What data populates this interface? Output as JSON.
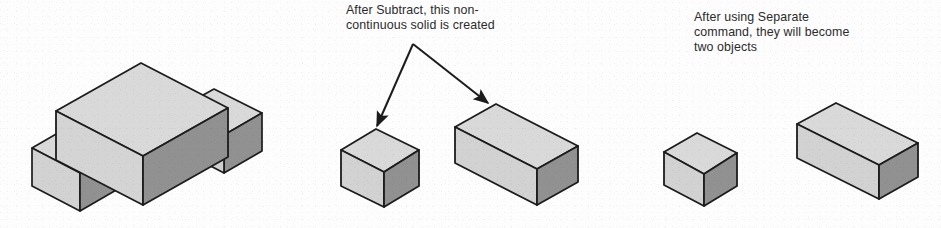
{
  "figure": {
    "background_color": "#fdfdfd"
  },
  "palette": {
    "top_face": "#d9d9d9",
    "left_face": "#d2d2d2",
    "front_face": "#919191",
    "outline": "#1c1c1c",
    "text": "#2b2b2b",
    "arrow": "#1c1c1c"
  },
  "annotations": [
    {
      "id": "anno-subtract",
      "name": "annotation-subtract",
      "lines": [
        "After Subtract, this non-",
        "continuous solid is created"
      ],
      "text": "After Subtract, this non-\ncontinuous solid is created",
      "x": 346,
      "y": 3
    },
    {
      "id": "anno-separate",
      "name": "annotation-separate",
      "lines": [
        "After using Separate",
        "command, they will become",
        "two objects"
      ],
      "text": "After using Separate\ncommand, they will become\ntwo objects",
      "x": 694,
      "y": 10
    }
  ],
  "arrows": [
    {
      "name": "arrow-to-small-cube",
      "from": [
        413,
        44
      ],
      "to": [
        374,
        131
      ],
      "head": "filled-triangle"
    },
    {
      "name": "arrow-to-large-box",
      "from": [
        413,
        44
      ],
      "to": [
        491,
        108
      ],
      "head": "filled-triangle"
    }
  ],
  "shapes": [
    {
      "name": "cross-solid",
      "label": "Non-continuous cross-shaped solid",
      "group": "left",
      "faces": [
        "top",
        "left",
        "front"
      ]
    },
    {
      "name": "subtract-small-cube",
      "label": "Small cube result of Subtract",
      "group": "middle",
      "faces": [
        "top",
        "left",
        "front"
      ]
    },
    {
      "name": "subtract-large-box",
      "label": "Large box result of Subtract",
      "group": "middle",
      "faces": [
        "top",
        "left",
        "front"
      ]
    },
    {
      "name": "separate-small-cube",
      "label": "Small cube after Separate",
      "group": "right",
      "faces": [
        "top",
        "left",
        "front"
      ]
    },
    {
      "name": "separate-large-box",
      "label": "Large box after Separate",
      "group": "right",
      "faces": [
        "top",
        "left",
        "front"
      ]
    }
  ]
}
